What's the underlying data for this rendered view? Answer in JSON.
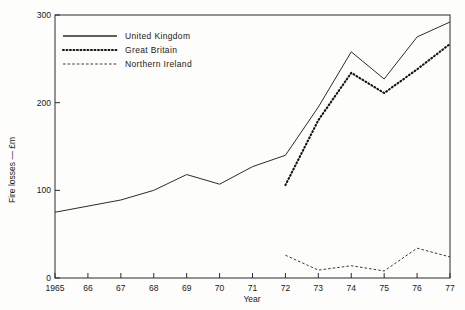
{
  "chart_data": {
    "type": "line",
    "title": "",
    "subtitle": "",
    "xlabel": "Year",
    "ylabel": "Fire losses — £m",
    "x": [
      1965,
      1966,
      1967,
      1968,
      1969,
      1970,
      1971,
      1972,
      1973,
      1974,
      1975,
      1976,
      1977
    ],
    "xtick_labels": [
      "1965",
      "66",
      "67",
      "68",
      "69",
      "70",
      "71",
      "72",
      "73",
      "74",
      "75",
      "76",
      "77"
    ],
    "ytick_labels": [
      "0",
      "100",
      "200",
      "300"
    ],
    "ytick_values": [
      0,
      100,
      200,
      300
    ],
    "xlim": [
      1965,
      1977
    ],
    "ylim": [
      0,
      300
    ],
    "grid": false,
    "legend_position": "top-left-inside",
    "series": [
      {
        "name": "United Kingdom",
        "style": "solid",
        "color": "#2b2b2b",
        "x": [
          1965,
          1966,
          1967,
          1968,
          1969,
          1970,
          1971,
          1972,
          1973,
          1974,
          1975,
          1976,
          1977
        ],
        "values": [
          75,
          82,
          89,
          100,
          118,
          107,
          127,
          140,
          195,
          258,
          227,
          275,
          292
        ]
      },
      {
        "name": "Great Britain",
        "style": "dotted",
        "color": "#141414",
        "x": [
          1972,
          1973,
          1974,
          1975,
          1976,
          1977
        ],
        "values": [
          106,
          180,
          234,
          211,
          238,
          267
        ]
      },
      {
        "name": "Northern Ireland",
        "style": "dashed",
        "color": "#3a3a3a",
        "x": [
          1972,
          1973,
          1974,
          1975,
          1976,
          1977
        ],
        "values": [
          26,
          9,
          14,
          8,
          34,
          24
        ]
      }
    ]
  },
  "legend": {
    "items": [
      {
        "label": "United Kingdom"
      },
      {
        "label": "Great Britain"
      },
      {
        "label": "Northern Ireland"
      }
    ]
  },
  "axes": {
    "y_title": "Fire losses — £m",
    "x_title": "Year",
    "y_labels": [
      "300",
      "200",
      "100",
      "0"
    ],
    "x_labels": [
      "1965",
      "66",
      "67",
      "68",
      "69",
      "70",
      "71",
      "72",
      "73",
      "74",
      "75",
      "76",
      "77"
    ]
  }
}
